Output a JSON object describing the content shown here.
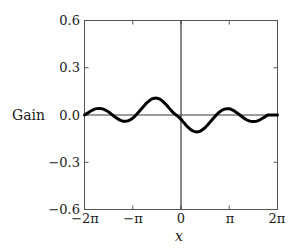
{
  "chart_data": {
    "type": "line",
    "title": "",
    "subtitle": "",
    "xlabel": "x",
    "ylabel": "Gain",
    "xlim": [
      -6.283185307179586,
      6.283185307179586
    ],
    "ylim": [
      -0.6,
      0.6
    ],
    "grid": false,
    "legend": null,
    "x_tick_labels": [
      "−2π",
      "−π",
      "0",
      "π",
      "2π"
    ],
    "x_tick_values": [
      -6.283185307179586,
      -3.141592653589793,
      0,
      3.141592653589793,
      6.283185307179586
    ],
    "y_tick_labels": [
      "0.6",
      "0.3",
      "0.0",
      "−0.3",
      "−0.6"
    ],
    "y_tick_values": [
      0.6,
      0.3,
      0.0,
      -0.3,
      -0.6
    ],
    "series": [
      {
        "name": "Gain",
        "color": "#000000",
        "line_width": 3,
        "x": [
          -6.2832,
          -6.1261,
          -5.969,
          -5.8119,
          -5.6549,
          -5.4978,
          -5.3407,
          -5.1836,
          -5.0265,
          -4.8695,
          -4.7124,
          -4.5553,
          -4.3982,
          -4.2412,
          -4.0841,
          -3.927,
          -3.7699,
          -3.6128,
          -3.4558,
          -3.2987,
          -3.1416,
          -2.9845,
          -2.8274,
          -2.6704,
          -2.5133,
          -2.3562,
          -2.1991,
          -2.042,
          -1.885,
          -1.7279,
          -1.5708,
          -1.4137,
          -1.2566,
          -1.0996,
          -0.9425,
          -0.7854,
          -0.6283,
          -0.4712,
          -0.3142,
          -0.1571,
          0.0,
          0.1571,
          0.3142,
          0.4712,
          0.6283,
          0.7854,
          0.9425,
          1.0996,
          1.2566,
          1.4137,
          1.5708,
          1.7279,
          1.885,
          2.042,
          2.1991,
          2.3562,
          2.5133,
          2.6704,
          2.8274,
          2.9845,
          3.1416,
          3.2987,
          3.4558,
          3.6128,
          3.7699,
          3.927,
          4.0841,
          4.2412,
          4.3982,
          4.5553,
          4.7124,
          4.8695,
          5.0265,
          5.1836,
          5.3407,
          5.4978,
          5.6549,
          5.8119,
          5.969,
          6.1261,
          6.2832
        ],
        "y": [
          0.0,
          0.0098,
          0.0196,
          0.0285,
          0.0356,
          0.0403,
          0.042,
          0.0405,
          0.0359,
          0.0284,
          0.0186,
          0.0073,
          -0.0046,
          -0.0162,
          -0.0264,
          -0.0343,
          -0.0391,
          -0.0402,
          -0.0373,
          -0.0304,
          -0.0197,
          -0.0059,
          0.0104,
          0.0282,
          0.0464,
          0.064,
          0.0797,
          0.0926,
          0.1018,
          0.1066,
          0.1066,
          0.1017,
          0.0923,
          0.079,
          0.0629,
          0.0453,
          0.0278,
          0.0122,
          0.0,
          -0.0122,
          -0.0278,
          -0.0453,
          -0.0629,
          -0.079,
          -0.0923,
          -0.1017,
          -0.1066,
          -0.1066,
          -0.1018,
          -0.0926,
          -0.0797,
          -0.064,
          -0.0464,
          -0.0282,
          -0.0104,
          0.0059,
          0.0197,
          0.0304,
          0.0373,
          0.0402,
          0.0391,
          0.0343,
          0.0264,
          0.0162,
          0.0046,
          -0.0073,
          -0.0186,
          -0.0284,
          -0.0359,
          -0.0405,
          -0.042,
          -0.0403,
          -0.0356,
          -0.0285,
          -0.0196,
          -0.0098,
          0.0,
          0.0,
          0.0,
          0.0,
          0.0
        ],
        "annotations": [
          {
            "label": "peak",
            "x": -1.54,
            "y": 0.54
          },
          {
            "label": "trough",
            "x": 1.54,
            "y": -0.54
          },
          {
            "label": "zero-crossing",
            "x": 0.0,
            "y": 0.0
          }
        ]
      }
    ]
  },
  "axes": {
    "y_label": "Gain",
    "x_label": "x"
  }
}
